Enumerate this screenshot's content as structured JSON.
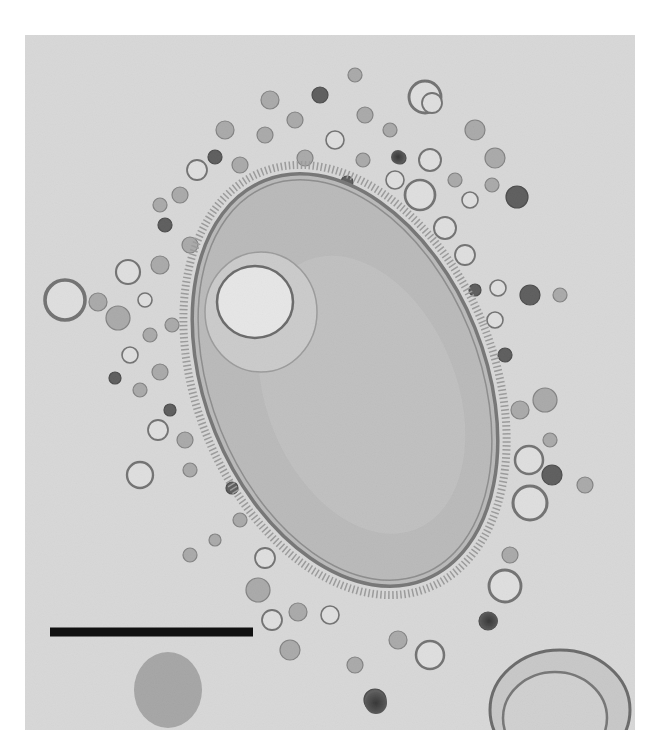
{
  "image": {
    "kind": "transmission electron micrograph",
    "subject": "bacterial cell surrounded by membrane vesicles",
    "frame": {
      "x": 25,
      "y": 35,
      "width": 610,
      "height": 695
    },
    "background_color": "#d9d9d9",
    "page_color": "#ffffff"
  },
  "cell": {
    "cx": 345,
    "cy": 380,
    "rx": 140,
    "ry": 215,
    "rotation": -22,
    "fill": "#b2b2b2",
    "outline": "#5a5a5a"
  },
  "inclusion": {
    "cx": 255,
    "cy": 302,
    "rx": 38,
    "ry": 36,
    "fill": "#ececec",
    "outline": "#4a4a4a"
  },
  "scale_bar": {
    "x1": 50,
    "x2": 253,
    "y": 632,
    "thickness": 9,
    "color": "#111111",
    "label": ""
  },
  "vesicles": [
    {
      "cx": 425,
      "cy": 97,
      "r": 16,
      "type": "hollow"
    },
    {
      "cx": 432,
      "cy": 103,
      "r": 10,
      "type": "hollow"
    },
    {
      "cx": 430,
      "cy": 160,
      "r": 11,
      "type": "hollow"
    },
    {
      "cx": 400,
      "cy": 158,
      "r": 6,
      "type": "dark"
    },
    {
      "cx": 395,
      "cy": 180,
      "r": 9,
      "type": "hollow"
    },
    {
      "cx": 420,
      "cy": 195,
      "r": 15,
      "type": "hollow"
    },
    {
      "cx": 445,
      "cy": 228,
      "r": 11,
      "type": "hollow"
    },
    {
      "cx": 465,
      "cy": 255,
      "r": 10,
      "type": "hollow"
    },
    {
      "cx": 475,
      "cy": 130,
      "r": 10,
      "type": "gray"
    },
    {
      "cx": 495,
      "cy": 158,
      "r": 10,
      "type": "gray"
    },
    {
      "cx": 517,
      "cy": 197,
      "r": 11,
      "type": "dark"
    },
    {
      "cx": 492,
      "cy": 185,
      "r": 7,
      "type": "gray"
    },
    {
      "cx": 455,
      "cy": 180,
      "r": 7,
      "type": "gray"
    },
    {
      "cx": 470,
      "cy": 200,
      "r": 8,
      "type": "hollow"
    },
    {
      "cx": 475,
      "cy": 290,
      "r": 6,
      "type": "dark"
    },
    {
      "cx": 498,
      "cy": 288,
      "r": 8,
      "type": "hollow"
    },
    {
      "cx": 530,
      "cy": 295,
      "r": 10,
      "type": "dark"
    },
    {
      "cx": 560,
      "cy": 295,
      "r": 7,
      "type": "gray"
    },
    {
      "cx": 505,
      "cy": 355,
      "r": 7,
      "type": "dark"
    },
    {
      "cx": 495,
      "cy": 320,
      "r": 8,
      "type": "hollow"
    },
    {
      "cx": 520,
      "cy": 410,
      "r": 9,
      "type": "gray"
    },
    {
      "cx": 545,
      "cy": 400,
      "r": 12,
      "type": "gray"
    },
    {
      "cx": 529,
      "cy": 460,
      "r": 14,
      "type": "hollow"
    },
    {
      "cx": 552,
      "cy": 475,
      "r": 10,
      "type": "dark"
    },
    {
      "cx": 530,
      "cy": 503,
      "r": 17,
      "type": "hollow"
    },
    {
      "cx": 550,
      "cy": 440,
      "r": 7,
      "type": "gray"
    },
    {
      "cx": 585,
      "cy": 485,
      "r": 8,
      "type": "gray"
    },
    {
      "cx": 510,
      "cy": 555,
      "r": 8,
      "type": "gray"
    },
    {
      "cx": 505,
      "cy": 586,
      "r": 16,
      "type": "hollow"
    },
    {
      "cx": 488,
      "cy": 621,
      "r": 9,
      "type": "dark"
    },
    {
      "cx": 430,
      "cy": 655,
      "r": 14,
      "type": "hollow"
    },
    {
      "cx": 398,
      "cy": 640,
      "r": 9,
      "type": "gray"
    },
    {
      "cx": 355,
      "cy": 665,
      "r": 8,
      "type": "gray"
    },
    {
      "cx": 375,
      "cy": 700,
      "r": 11,
      "type": "dark"
    },
    {
      "cx": 330,
      "cy": 615,
      "r": 9,
      "type": "hollow"
    },
    {
      "cx": 298,
      "cy": 612,
      "r": 9,
      "type": "gray"
    },
    {
      "cx": 272,
      "cy": 620,
      "r": 10,
      "type": "hollow"
    },
    {
      "cx": 290,
      "cy": 650,
      "r": 10,
      "type": "gray"
    },
    {
      "cx": 265,
      "cy": 558,
      "r": 10,
      "type": "hollow"
    },
    {
      "cx": 258,
      "cy": 590,
      "r": 12,
      "type": "gray"
    },
    {
      "cx": 240,
      "cy": 520,
      "r": 7,
      "type": "gray"
    },
    {
      "cx": 232,
      "cy": 488,
      "r": 6,
      "type": "dark"
    },
    {
      "cx": 140,
      "cy": 475,
      "r": 13,
      "type": "hollow"
    },
    {
      "cx": 158,
      "cy": 430,
      "r": 10,
      "type": "hollow"
    },
    {
      "cx": 185,
      "cy": 440,
      "r": 8,
      "type": "gray"
    },
    {
      "cx": 190,
      "cy": 470,
      "r": 7,
      "type": "gray"
    },
    {
      "cx": 170,
      "cy": 410,
      "r": 6,
      "type": "dark"
    },
    {
      "cx": 115,
      "cy": 378,
      "r": 6,
      "type": "dark"
    },
    {
      "cx": 140,
      "cy": 390,
      "r": 7,
      "type": "gray"
    },
    {
      "cx": 160,
      "cy": 372,
      "r": 8,
      "type": "gray"
    },
    {
      "cx": 130,
      "cy": 355,
      "r": 8,
      "type": "hollow"
    },
    {
      "cx": 150,
      "cy": 335,
      "r": 7,
      "type": "gray"
    },
    {
      "cx": 172,
      "cy": 325,
      "r": 7,
      "type": "gray"
    },
    {
      "cx": 145,
      "cy": 300,
      "r": 7,
      "type": "hollow"
    },
    {
      "cx": 118,
      "cy": 318,
      "r": 12,
      "type": "gray"
    },
    {
      "cx": 65,
      "cy": 300,
      "r": 20,
      "type": "hollow"
    },
    {
      "cx": 98,
      "cy": 302,
      "r": 9,
      "type": "gray"
    },
    {
      "cx": 128,
      "cy": 272,
      "r": 12,
      "type": "hollow"
    },
    {
      "cx": 160,
      "cy": 265,
      "r": 9,
      "type": "gray"
    },
    {
      "cx": 190,
      "cy": 245,
      "r": 8,
      "type": "gray"
    },
    {
      "cx": 165,
      "cy": 225,
      "r": 7,
      "type": "dark"
    },
    {
      "cx": 180,
      "cy": 195,
      "r": 8,
      "type": "gray"
    },
    {
      "cx": 160,
      "cy": 205,
      "r": 7,
      "type": "gray"
    },
    {
      "cx": 197,
      "cy": 170,
      "r": 10,
      "type": "hollow"
    },
    {
      "cx": 215,
      "cy": 157,
      "r": 7,
      "type": "dark"
    },
    {
      "cx": 240,
      "cy": 165,
      "r": 8,
      "type": "gray"
    },
    {
      "cx": 225,
      "cy": 130,
      "r": 9,
      "type": "gray"
    },
    {
      "cx": 265,
      "cy": 135,
      "r": 8,
      "type": "gray"
    },
    {
      "cx": 270,
      "cy": 100,
      "r": 9,
      "type": "gray"
    },
    {
      "cx": 295,
      "cy": 120,
      "r": 8,
      "type": "gray"
    },
    {
      "cx": 305,
      "cy": 158,
      "r": 8,
      "type": "gray"
    },
    {
      "cx": 335,
      "cy": 140,
      "r": 9,
      "type": "hollow"
    },
    {
      "cx": 320,
      "cy": 95,
      "r": 8,
      "type": "dark"
    },
    {
      "cx": 365,
      "cy": 115,
      "r": 8,
      "type": "gray"
    },
    {
      "cx": 355,
      "cy": 75,
      "r": 7,
      "type": "gray"
    },
    {
      "cx": 390,
      "cy": 130,
      "r": 7,
      "type": "gray"
    },
    {
      "cx": 363,
      "cy": 160,
      "r": 7,
      "type": "gray"
    },
    {
      "cx": 347,
      "cy": 182,
      "r": 6,
      "type": "dark"
    },
    {
      "cx": 190,
      "cy": 555,
      "r": 7,
      "type": "gray"
    },
    {
      "cx": 215,
      "cy": 540,
      "r": 6,
      "type": "gray"
    }
  ],
  "dark_bodies": [
    {
      "cx": 398,
      "cy": 157,
      "r": 7
    },
    {
      "cx": 489,
      "cy": 621,
      "r": 9
    },
    {
      "cx": 376,
      "cy": 703,
      "r": 11
    }
  ],
  "bottom_structures": [
    {
      "cx": 168,
      "cy": 690,
      "rx": 34,
      "ry": 38,
      "fill": "#8c8c8c"
    },
    {
      "cx": 560,
      "cy": 710,
      "rx": 70,
      "ry": 60,
      "fill": "none"
    }
  ]
}
